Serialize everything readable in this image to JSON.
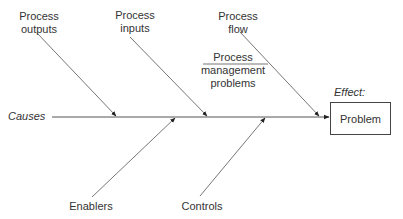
{
  "diagram": {
    "type": "fishbone",
    "spine_label": "Causes",
    "effect_label": "Effect:",
    "effect_box": "Problem",
    "top_causes": [
      {
        "line1": "Process",
        "line2": "outputs"
      },
      {
        "line1": "Process",
        "line2": "inputs"
      },
      {
        "line1": "Process",
        "line2": "flow"
      }
    ],
    "sub_cause": {
      "line1": "Process",
      "line2": "management",
      "line3": "problems"
    },
    "bottom_causes": [
      "Enablers",
      "Controls"
    ],
    "colors": {
      "line": "#555555",
      "text": "#333333",
      "background": "#ffffff"
    }
  }
}
